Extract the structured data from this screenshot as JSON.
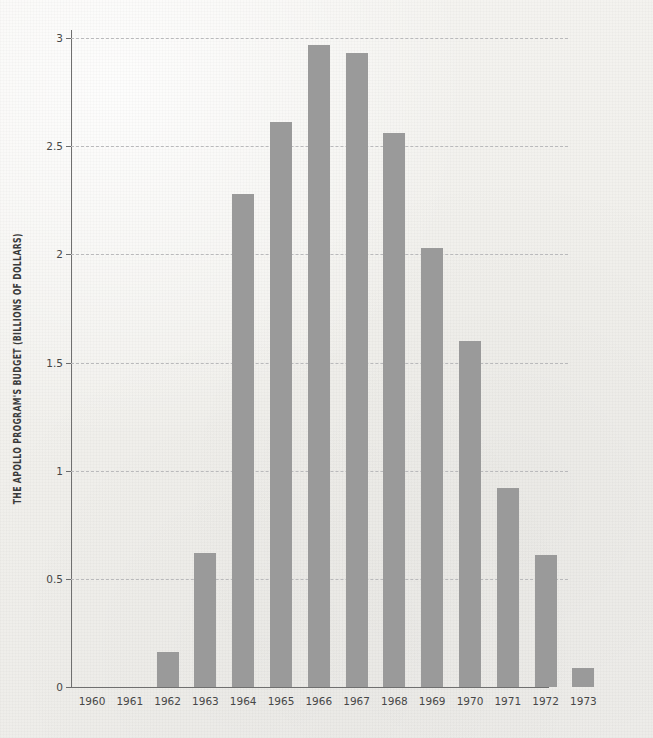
{
  "chart_data": {
    "type": "bar",
    "title": "",
    "xlabel": "",
    "ylabel": "THE APOLLO PROGRAM'S BUDGET (BILLIONS OF DOLLARS)",
    "categories": [
      "1960",
      "1961",
      "1962",
      "1963",
      "1964",
      "1965",
      "1966",
      "1967",
      "1968",
      "1969",
      "1970",
      "1971",
      "1972",
      "1973"
    ],
    "values": [
      0,
      0,
      0.16,
      0.62,
      2.28,
      2.61,
      2.97,
      2.93,
      2.56,
      2.03,
      1.6,
      0.92,
      0.61,
      0.09
    ],
    "ylim": [
      0,
      3
    ],
    "yticks": [
      0,
      0.5,
      1,
      1.5,
      2,
      2.5,
      3
    ],
    "ytick_labels": [
      "0",
      "0.5",
      "1",
      "1.5",
      "2",
      "2.5",
      "3"
    ],
    "grid": true,
    "grid_style": "dashed",
    "grid_axis": "y",
    "legend": "none",
    "bar_color": "#9a9a9a",
    "background_color": "#f3f2ef",
    "axis_color": "#6f6f6f",
    "gridline_color": "#b9b9bb",
    "tick_label_color": "#474747"
  }
}
